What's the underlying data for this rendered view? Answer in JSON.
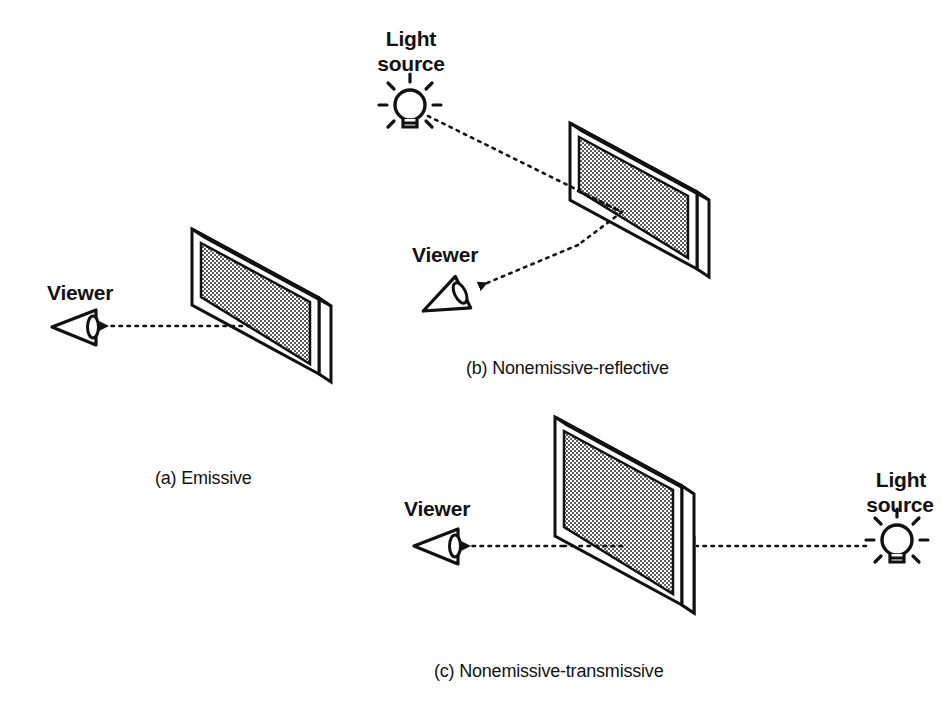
{
  "figure": {
    "background_color": "#ffffff",
    "ink_color": "#111111",
    "screen_fill_color": "#a8a8a8",
    "bezel_fill_color": "#ffffff"
  },
  "panels": [
    {
      "id": "a",
      "caption": "(a) Emissive",
      "viewer_label": "Viewer",
      "light_source_label": null,
      "ray_description": "Light travels from the display screen directly to the viewer"
    },
    {
      "id": "b",
      "caption": "(b) Nonemissive-reflective",
      "viewer_label": "Viewer",
      "light_source_label": "Light\nsource",
      "light_source_label_line1": "Light",
      "light_source_label_line2": "source",
      "ray_description": "Light travels from the external source onto the screen and reflects to the viewer"
    },
    {
      "id": "c",
      "caption": "(c) Nonemissive-transmissive",
      "viewer_label": "Viewer",
      "light_source_label": "Light\nsource",
      "light_source_label_line1": "Light",
      "light_source_label_line2": "source",
      "ray_description": "Light travels from the external source behind the panel, through the screen, to the viewer"
    }
  ],
  "icons": {
    "eye_viewer": "viewer-eye-icon",
    "light_bulb": "light-bulb-icon",
    "arrow_head": "arrow-head-icon",
    "dotted_ray": "dotted-ray-line"
  }
}
